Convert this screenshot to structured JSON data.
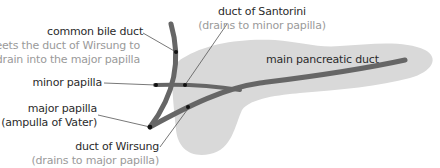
{
  "diagram": {
    "colors": {
      "pancreas_fill": "#d9d9d9",
      "duct_stroke": "#666666",
      "leader_line": "#555555",
      "dot": "#111111",
      "label_primary": "#2b2b2b",
      "label_secondary": "#9a9a9a"
    },
    "labels": {
      "common_bile_duct": {
        "title": "common bile duct",
        "note_line1": "meets the duct of Wirsung to",
        "note_line2": "drain into the major papilla"
      },
      "minor_papilla": {
        "title": "minor papilla"
      },
      "major_papilla": {
        "title_line1": "major papilla",
        "title_line2": "(ampulla of Vater)"
      },
      "duct_of_wirsung": {
        "title": "duct of Wirsung",
        "note": "(drains to major papilla)"
      },
      "duct_of_santorini": {
        "title": "duct of Santorini",
        "note": "(drains to minor papilla)"
      },
      "main_pancreatic_duct": {
        "title": "main pancreatic duct"
      }
    }
  }
}
